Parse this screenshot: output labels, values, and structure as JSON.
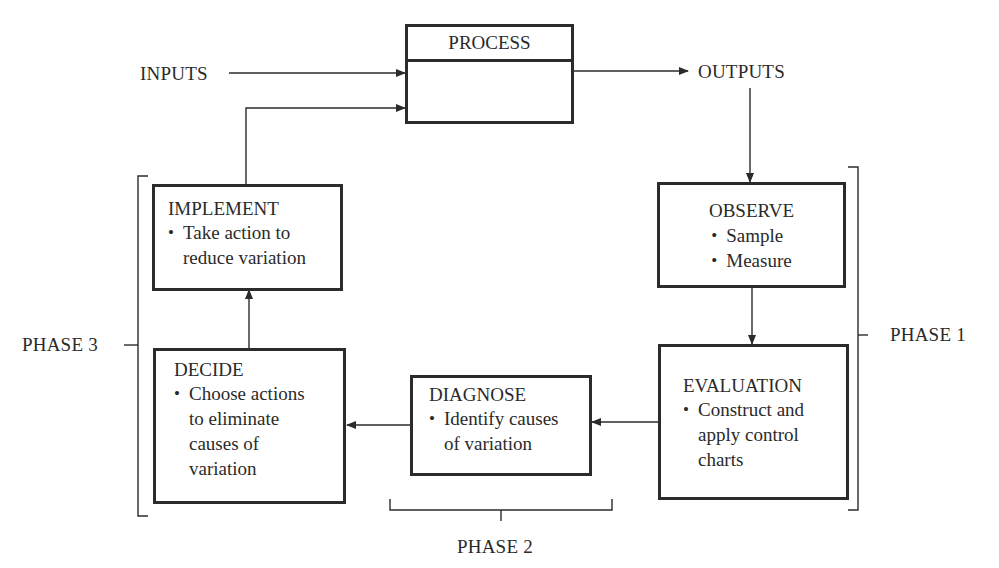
{
  "diagram": {
    "type": "process-improvement-cycle",
    "process": {
      "title": "PROCESS"
    },
    "inputs_label": "INPUTS",
    "outputs_label": "OUTPUTS",
    "boxes": {
      "observe": {
        "title": "OBSERVE",
        "items": [
          "Sample",
          "Measure"
        ]
      },
      "evaluation": {
        "title": "EVALUATION",
        "items": [
          "Construct and",
          "apply control",
          "charts"
        ]
      },
      "diagnose": {
        "title": "DIAGNOSE",
        "items": [
          "Identify causes",
          "of variation"
        ]
      },
      "decide": {
        "title": "DECIDE",
        "items": [
          "Choose actions",
          "to eliminate",
          "causes of",
          "variation"
        ]
      },
      "implement": {
        "title": "IMPLEMENT",
        "items": [
          "Take action to",
          "reduce variation"
        ]
      }
    },
    "phases": {
      "phase1": "PHASE 1",
      "phase2": "PHASE 2",
      "phase3": "PHASE 3"
    },
    "colors": {
      "line": "#2b2b2b",
      "text": "#2a2a2a",
      "background": "#ffffff"
    }
  }
}
